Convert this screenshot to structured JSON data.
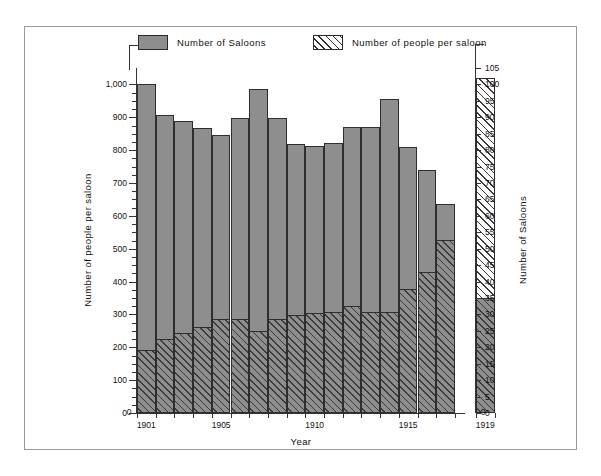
{
  "legend": {
    "saloons": {
      "label": "Number of Saloons",
      "swatch": "solid-gray-swatch",
      "color": "#8e8e8e"
    },
    "people": {
      "label": "Number of people per saloon",
      "swatch": "hatched-swatch",
      "color": "#ffffff"
    }
  },
  "axes": {
    "left": {
      "title": "Number of people per saloon",
      "ticks": [
        "0",
        "100",
        "200",
        "300",
        "400",
        "500",
        "600",
        "700",
        "800",
        "900",
        "1,000"
      ]
    },
    "right": {
      "title": "Number of Saloons",
      "ticks": [
        "0",
        "5",
        "10",
        "15",
        "20",
        "25",
        "30",
        "35",
        "40",
        "45",
        "50",
        "55",
        "60",
        "65",
        "70",
        "75",
        "80",
        "85",
        "90",
        "95",
        "100",
        "105"
      ]
    },
    "bottom": {
      "title": "Year",
      "ticks": [
        "1901",
        "1905",
        "1910",
        "1915",
        "1919"
      ]
    }
  },
  "chart_data": {
    "type": "bar",
    "title": "",
    "xlabel": "Year",
    "ylabel": "Number of people per saloon",
    "y2label": "Number of Saloons",
    "ylim": [
      0,
      1050
    ],
    "y2lim": [
      0,
      105
    ],
    "grid": false,
    "legend_position": "top",
    "categories": [
      "1901",
      "1902",
      "1903",
      "1904",
      "1905",
      "1906",
      "1907",
      "1908",
      "1909",
      "1910",
      "1911",
      "1912",
      "1913",
      "1914",
      "1915",
      "1916",
      "1917",
      "1919"
    ],
    "separated_category": "1919",
    "series": [
      {
        "name": "Number of Saloons",
        "axis": "right",
        "unit": "saloons",
        "values": [
          100,
          90.7,
          88.8,
          86.8,
          84.7,
          89.7,
          98.5,
          89.7,
          82.0,
          81.3,
          82.2,
          87.0,
          87.0,
          95.7,
          81.0,
          74.0,
          63.5,
          35.0
        ]
      },
      {
        "name": "Number of people per saloon",
        "axis": "left",
        "unit": "people",
        "values": [
          192,
          225,
          245,
          263,
          285,
          285,
          250,
          287,
          298,
          303,
          307,
          325,
          307,
          307,
          376,
          430,
          528,
          1020
        ]
      }
    ]
  }
}
